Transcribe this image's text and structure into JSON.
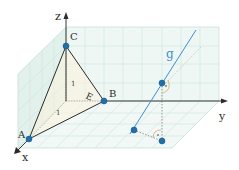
{
  "diagram": {
    "colors": {
      "grid": "#b9d9d3",
      "plane_fill": "#e6f3ef",
      "axis": "#3a3a3a",
      "edge": "#2b2b2b",
      "point": "#1f6fa8",
      "line_g": "#3f8fcf",
      "dashed": "#555555",
      "angle_arc": "#c8a060",
      "triangle_fill": "#fbf3dc"
    },
    "axes": {
      "x_label": "x",
      "y_label": "y",
      "z_label": "z"
    },
    "points": {
      "A": "A",
      "B": "B",
      "C": "C",
      "E": "E"
    },
    "line_label": "g",
    "unit_labels": {
      "z_unit": "1",
      "x_unit": "1"
    },
    "right_angle_marks": [
      "·",
      "·"
    ]
  }
}
